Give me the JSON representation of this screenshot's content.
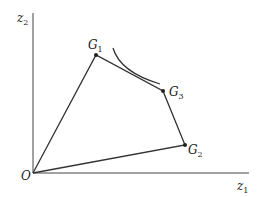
{
  "diagram": {
    "axes": {
      "x_label": "z",
      "x_sub": "1",
      "y_label": "z",
      "y_sub": "2",
      "origin_label": "O"
    },
    "points": [
      {
        "name": "G",
        "sub": "1",
        "x": 96,
        "y": 55
      },
      {
        "name": "G",
        "sub": "3",
        "x": 163,
        "y": 91
      },
      {
        "name": "G",
        "sub": "2",
        "x": 185,
        "y": 145
      }
    ],
    "polygon": [
      "O",
      "G1",
      "G3",
      "G2",
      "O"
    ],
    "tangent_curve": "indifference curve tangent to edge G1-G3",
    "colors": {
      "line": "#333333",
      "background": "#ffffff"
    }
  }
}
